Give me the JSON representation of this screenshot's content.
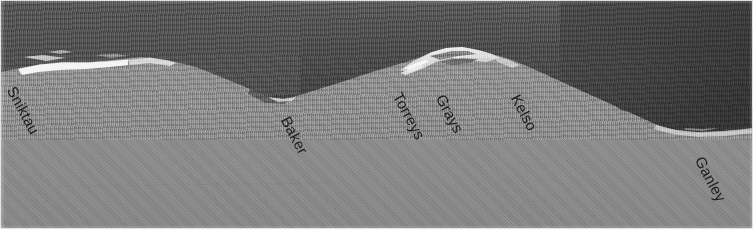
{
  "image": {
    "type": "annotated-panoramic-photograph",
    "subject": "mountain ridge skyline panorama",
    "width": 753,
    "height": 229,
    "colors": {
      "sky_dark": "#4e4e4e",
      "ridge_shadow": "#3f3f3f",
      "snowfield": "#8c8c8c",
      "snow_highlight": "#f2f2f2",
      "label_text": "#1a1a1a",
      "border": "#d9d9d9"
    }
  },
  "labels": [
    {
      "name": "Sniktau",
      "x": 18,
      "y": 84,
      "rotation": 62
    },
    {
      "name": "Baker",
      "x": 292,
      "y": 114,
      "rotation": 62
    },
    {
      "name": "Torreys",
      "x": 404,
      "y": 90,
      "rotation": 62
    },
    {
      "name": "Grays",
      "x": 447,
      "y": 92,
      "rotation": 62
    },
    {
      "name": "Kelso",
      "x": 522,
      "y": 92,
      "rotation": 62
    },
    {
      "name": "Ganley",
      "x": 706,
      "y": 154,
      "rotation": 62
    }
  ],
  "skyline": {
    "description": "dark forested/shadowed ridge above a pale snow slope",
    "ridge_path": "M 0,72 L 20,68 L 40,64 L 62,62 L 88,62 L 112,60 L 140,57 L 168,60 L 196,67 L 224,78 L 250,89 L 268,97 L 282,99 L 300,95 L 322,88 L 348,80 L 372,72 L 392,66 L 406,62 L 418,58 L 432,52 L 448,48 L 462,47 L 478,50 L 492,54 L 506,58 L 522,64 L 540,72 L 560,81 L 580,90 L 600,99 L 620,108 L 640,117 L 660,126 L 680,131 L 700,133 L 720,132 L 740,130 L 753,129",
    "snow_patches": [
      {
        "x": 20,
        "y": 62,
        "w": 112,
        "h": 11
      },
      {
        "x": 404,
        "y": 46,
        "w": 92,
        "h": 24
      },
      {
        "x": 652,
        "y": 124,
        "w": 101,
        "h": 9
      }
    ]
  }
}
